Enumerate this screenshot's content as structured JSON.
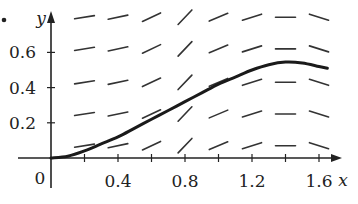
{
  "chart_data": {
    "type": "line",
    "title": "",
    "subtitle": "Slope field (direction field) with a solution curve",
    "xlabel": "x",
    "ylabel": "y",
    "origin_label": "0",
    "marker": "•",
    "xlim": [
      0,
      1.75
    ],
    "ylim": [
      0,
      0.85
    ],
    "x_ticks": [
      0.2,
      0.4,
      0.6,
      0.8,
      1.0,
      1.2,
      1.4,
      1.6
    ],
    "x_tick_labels": [
      {
        "value": 0.4,
        "label": "0.4"
      },
      {
        "value": 0.8,
        "label": "0.8"
      },
      {
        "value": 1.2,
        "label": "1.2"
      },
      {
        "value": 1.6,
        "label": "1.6"
      }
    ],
    "y_ticks": [
      0.2,
      0.4,
      0.6
    ],
    "y_tick_labels": [
      {
        "value": 0.2,
        "label": "0.2"
      },
      {
        "value": 0.4,
        "label": "0.4"
      },
      {
        "value": 0.6,
        "label": "0.6"
      }
    ],
    "grid": false,
    "legend": null,
    "slope_field": {
      "x": [
        0.2,
        0.4,
        0.6,
        0.8,
        1.0,
        1.2,
        1.4,
        1.6
      ],
      "y": [
        0.07,
        0.25,
        0.43,
        0.62,
        0.8
      ],
      "slopes_by_column": [
        0.15,
        0.2,
        0.45,
        1.0,
        0.4,
        0.3,
        0.0,
        -0.3
      ]
    },
    "series": [
      {
        "name": "solution curve",
        "x": [
          0,
          0.1,
          0.2,
          0.3,
          0.4,
          0.5,
          0.6,
          0.7,
          0.8,
          0.9,
          1.0,
          1.1,
          1.2,
          1.3,
          1.4,
          1.5,
          1.6,
          1.65
        ],
        "y": [
          0,
          0.01,
          0.04,
          0.08,
          0.12,
          0.17,
          0.22,
          0.27,
          0.32,
          0.37,
          0.42,
          0.46,
          0.5,
          0.53,
          0.545,
          0.54,
          0.52,
          0.51
        ]
      }
    ]
  }
}
